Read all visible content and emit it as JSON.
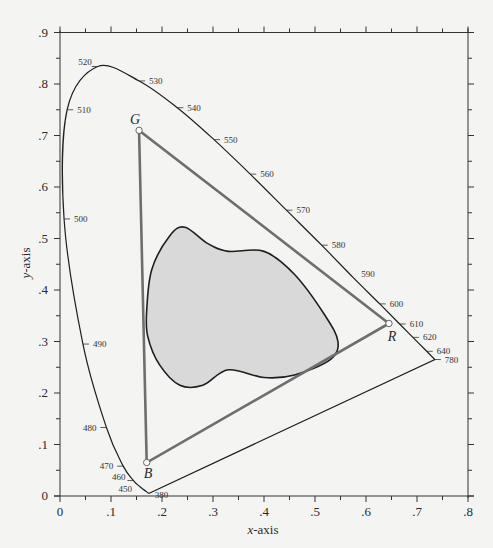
{
  "chart_data": {
    "type": "line",
    "title": "",
    "subtitle": "CIE 1931 chromaticity diagram with RGB gamut triangle and device gamut region",
    "xlabel": "x-axis",
    "ylabel": "y-axis",
    "xlim": [
      0,
      0.8
    ],
    "ylim": [
      0,
      0.9
    ],
    "grid": false,
    "legend": null,
    "x_ticks": [
      "0",
      ".1",
      ".2",
      ".3",
      ".4",
      ".5",
      ".6",
      ".7",
      ".8"
    ],
    "y_ticks": [
      "0",
      ".1",
      ".2",
      ".3",
      ".4",
      ".5",
      ".6",
      ".7",
      ".8",
      ".9"
    ],
    "series": [
      {
        "name": "spectral locus",
        "closed": true,
        "points": [
          {
            "wavelength": "380",
            "x": 0.174,
            "y": 0.005
          },
          {
            "wavelength": "450",
            "x": 0.157,
            "y": 0.018
          },
          {
            "wavelength": "460",
            "x": 0.144,
            "y": 0.03
          },
          {
            "wavelength": "470",
            "x": 0.124,
            "y": 0.058
          },
          {
            "wavelength": "480",
            "x": 0.091,
            "y": 0.133
          },
          {
            "wavelength": "490",
            "x": 0.045,
            "y": 0.295
          },
          {
            "wavelength": "500",
            "x": 0.008,
            "y": 0.538
          },
          {
            "wavelength": "510",
            "x": 0.014,
            "y": 0.75
          },
          {
            "wavelength": "520",
            "x": 0.074,
            "y": 0.834
          },
          {
            "wavelength": "530",
            "x": 0.155,
            "y": 0.806
          },
          {
            "wavelength": "540",
            "x": 0.23,
            "y": 0.754
          },
          {
            "wavelength": "550",
            "x": 0.302,
            "y": 0.692
          },
          {
            "wavelength": "560",
            "x": 0.373,
            "y": 0.625
          },
          {
            "wavelength": "570",
            "x": 0.444,
            "y": 0.555
          },
          {
            "wavelength": "580",
            "x": 0.513,
            "y": 0.487
          },
          {
            "wavelength": "590",
            "x": 0.575,
            "y": 0.424
          },
          {
            "wavelength": "600",
            "x": 0.627,
            "y": 0.373
          },
          {
            "wavelength": "610",
            "x": 0.666,
            "y": 0.334
          },
          {
            "wavelength": "620",
            "x": 0.692,
            "y": 0.308
          },
          {
            "wavelength": "640",
            "x": 0.719,
            "y": 0.281
          },
          {
            "wavelength": "780",
            "x": 0.735,
            "y": 0.265
          }
        ]
      },
      {
        "name": "RGB gamut triangle",
        "closed": true,
        "points": [
          {
            "label": "R",
            "x": 0.645,
            "y": 0.335
          },
          {
            "label": "G",
            "x": 0.155,
            "y": 0.71
          },
          {
            "label": "B",
            "x": 0.17,
            "y": 0.065
          }
        ]
      },
      {
        "name": "device gamut region (shaded)",
        "closed": true,
        "fill": "#d9d9d9",
        "points": [
          {
            "x": 0.17,
            "y": 0.36
          },
          {
            "x": 0.18,
            "y": 0.44
          },
          {
            "x": 0.215,
            "y": 0.505
          },
          {
            "x": 0.245,
            "y": 0.522
          },
          {
            "x": 0.29,
            "y": 0.49
          },
          {
            "x": 0.33,
            "y": 0.475
          },
          {
            "x": 0.4,
            "y": 0.475
          },
          {
            "x": 0.46,
            "y": 0.43
          },
          {
            "x": 0.52,
            "y": 0.35
          },
          {
            "x": 0.545,
            "y": 0.3
          },
          {
            "x": 0.53,
            "y": 0.265
          },
          {
            "x": 0.46,
            "y": 0.235
          },
          {
            "x": 0.4,
            "y": 0.23
          },
          {
            "x": 0.33,
            "y": 0.245
          },
          {
            "x": 0.28,
            "y": 0.215
          },
          {
            "x": 0.235,
            "y": 0.215
          },
          {
            "x": 0.195,
            "y": 0.255
          },
          {
            "x": 0.172,
            "y": 0.31
          }
        ]
      }
    ],
    "annotations": [
      "G",
      "R",
      "B",
      "520",
      "530",
      "540",
      "550",
      "560",
      "570",
      "580",
      "590",
      "600",
      "610",
      "620",
      "640",
      "780",
      "510",
      "500",
      "490",
      "480",
      "470",
      "460",
      "450",
      "380"
    ]
  },
  "labels": {
    "xlabel_italic": "x",
    "xlabel_rest": "-axis",
    "ylabel_italic": "y",
    "ylabel_rest": "-axis",
    "vertex_r": "R",
    "vertex_g": "G",
    "vertex_b": "B"
  },
  "colors": {
    "background": "#f4f4f2",
    "locus": "#1e1e1e",
    "triangle": "#6e6e6e",
    "gamut_fill": "#d9d9d9",
    "gamut_stroke": "#1e1e1e"
  }
}
